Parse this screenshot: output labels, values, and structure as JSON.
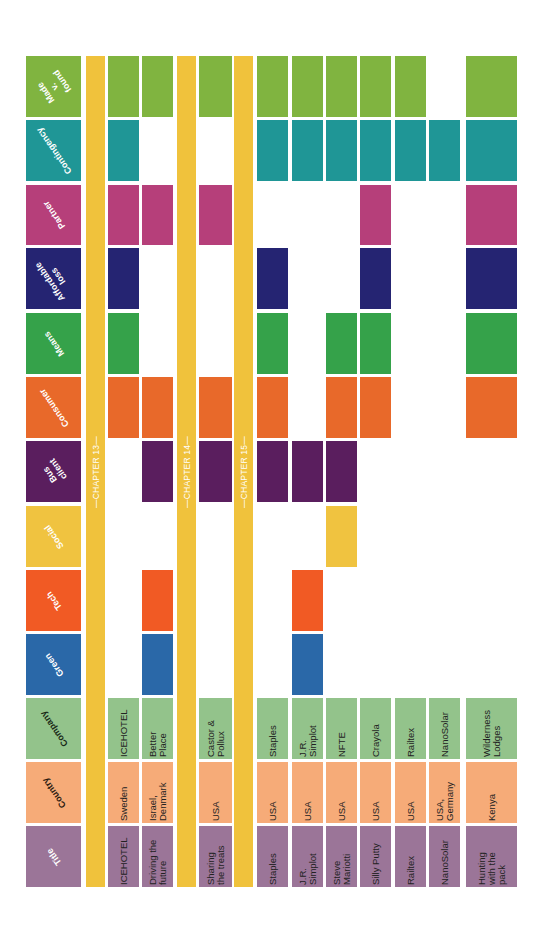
{
  "chart_data": {
    "type": "table",
    "title": "",
    "orientation": "rotated 90deg counter-clockwise (headers on left, text reads bottom-to-top)",
    "columns": [
      {
        "key": "title",
        "label": "Title",
        "color": "#9b7598",
        "text_color": "#ffffff"
      },
      {
        "key": "country",
        "label": "Country",
        "color": "#f6ab78",
        "text_color": "#2a1a10"
      },
      {
        "key": "company",
        "label": "Company",
        "color": "#93c38b",
        "text_color": "#1a2a18"
      },
      {
        "key": "green",
        "label": "Green",
        "color": "#2a68a8",
        "text_color": "#ffffff"
      },
      {
        "key": "tech",
        "label": "Tech",
        "color": "#f15a24",
        "text_color": "#ffffff"
      },
      {
        "key": "social",
        "label": "Social",
        "color": "#f0c340",
        "text_color": "#ffffff"
      },
      {
        "key": "bus_client",
        "label": "Bus\nclient",
        "color": "#5a1e5e",
        "text_color": "#ffffff"
      },
      {
        "key": "consumer",
        "label": "Consumer",
        "color": "#e8692a",
        "text_color": "#ffffff"
      },
      {
        "key": "means",
        "label": "Means",
        "color": "#35a24a",
        "text_color": "#ffffff"
      },
      {
        "key": "affordable_loss",
        "label": "Affordable\nloss",
        "color": "#252472",
        "text_color": "#ffffff"
      },
      {
        "key": "partner",
        "label": "Partner",
        "color": "#b63f7a",
        "text_color": "#ffffff"
      },
      {
        "key": "contingency",
        "label": "Contingency",
        "color": "#1f9696",
        "text_color": "#ffffff"
      },
      {
        "key": "made_v_found",
        "label": "Made\nv. found",
        "color": "#80b440",
        "text_color": "#ffffff"
      }
    ],
    "chapters": [
      {
        "label": "—CHAPTER 13—",
        "before_row": 0
      },
      {
        "label": "—CHAPTER 14—",
        "before_row": 2
      },
      {
        "label": "—CHAPTER 15—",
        "before_row": 3
      }
    ],
    "rows": [
      {
        "title": "ICEHOTEL",
        "country": "Sweden",
        "company": "ICEHOTEL",
        "green": false,
        "tech": false,
        "social": false,
        "bus_client": false,
        "consumer": true,
        "means": true,
        "affordable_loss": true,
        "partner": true,
        "contingency": true,
        "made_v_found": true
      },
      {
        "title": "Driving the\nfuture",
        "country": "Israel,\nDenmark",
        "company": "Better\nPlace",
        "green": true,
        "tech": true,
        "social": false,
        "bus_client": true,
        "consumer": true,
        "means": false,
        "affordable_loss": false,
        "partner": true,
        "contingency": false,
        "made_v_found": true
      },
      {
        "title": "Sharing\nthe treats",
        "country": "USA",
        "company": "Castor &\nPollux",
        "green": false,
        "tech": false,
        "social": false,
        "bus_client": true,
        "consumer": true,
        "means": false,
        "affordable_loss": false,
        "partner": true,
        "contingency": false,
        "made_v_found": true
      },
      {
        "title": "Staples",
        "country": "USA",
        "company": "Staples",
        "green": false,
        "tech": false,
        "social": false,
        "bus_client": true,
        "consumer": true,
        "means": true,
        "affordable_loss": true,
        "partner": false,
        "contingency": true,
        "made_v_found": true
      },
      {
        "title": "J.R.\nSimplot",
        "country": "USA",
        "company": "J.R.\nSimplot",
        "green": true,
        "tech": true,
        "social": false,
        "bus_client": true,
        "consumer": false,
        "means": false,
        "affordable_loss": false,
        "partner": false,
        "contingency": true,
        "made_v_found": true
      },
      {
        "title": "Steve\nMariotti",
        "country": "USA",
        "company": "NFTE",
        "green": false,
        "tech": false,
        "social": true,
        "bus_client": true,
        "consumer": true,
        "means": true,
        "affordable_loss": false,
        "partner": false,
        "contingency": true,
        "made_v_found": true
      },
      {
        "title": "Silly Putty",
        "country": "USA",
        "company": "Crayola",
        "green": false,
        "tech": false,
        "social": false,
        "bus_client": false,
        "consumer": true,
        "means": true,
        "affordable_loss": true,
        "partner": true,
        "contingency": true,
        "made_v_found": true
      },
      {
        "title": "Railtex",
        "country": "USA",
        "company": "Railtex",
        "green": false,
        "tech": false,
        "social": false,
        "bus_client": false,
        "consumer": false,
        "means": false,
        "affordable_loss": false,
        "partner": false,
        "contingency": true,
        "made_v_found": true
      },
      {
        "title": "NanoSolar",
        "country": "USA,\nGermany",
        "company": "NanoSolar",
        "green": false,
        "tech": false,
        "social": false,
        "bus_client": false,
        "consumer": false,
        "means": false,
        "affordable_loss": false,
        "partner": false,
        "contingency": true,
        "made_v_found": false
      },
      {
        "title": "Hunting\nwith the\npack",
        "country": "Kenya",
        "company": "Wilderness\nLodges",
        "green": false,
        "tech": false,
        "social": false,
        "bus_client": false,
        "consumer": true,
        "means": true,
        "affordable_loss": true,
        "partner": true,
        "contingency": true,
        "made_v_found": true
      }
    ],
    "chapter_color": "#f0c23c",
    "text_cell_columns": [
      "title",
      "country",
      "company"
    ]
  },
  "layout": {
    "header_x": [
      26,
      81
    ],
    "chapter_x": [
      [
        86,
        105
      ],
      [
        177,
        196
      ],
      [
        234,
        253
      ]
    ],
    "row_x": [
      [
        108,
        139
      ],
      [
        142,
        173
      ],
      [
        199,
        232
      ],
      [
        257,
        288
      ],
      [
        292,
        323
      ],
      [
        326,
        357
      ],
      [
        360,
        391
      ],
      [
        395,
        426
      ],
      [
        429,
        460
      ],
      [
        466,
        517
      ]
    ],
    "col_y": {
      "title": [
        826,
        887
      ],
      "country": [
        762,
        823
      ],
      "company": [
        698,
        759
      ],
      "green": [
        634,
        695
      ],
      "tech": [
        570,
        631
      ],
      "social": [
        506,
        567
      ],
      "bus_client": [
        441,
        502
      ],
      "consumer": [
        377,
        438
      ],
      "means": [
        313,
        374
      ],
      "affordable_loss": [
        248,
        309
      ],
      "partner": [
        185,
        245
      ],
      "contingency": [
        120,
        181
      ],
      "made_v_found": [
        56,
        117
      ]
    },
    "chapter_y": [
      56,
      887
    ]
  }
}
